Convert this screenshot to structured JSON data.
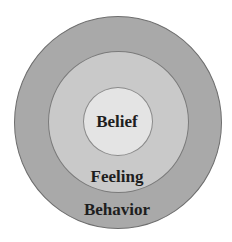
{
  "diagram": {
    "type": "concentric-circles",
    "layers": [
      {
        "id": "outer",
        "label": "Behavior",
        "fill": "#a9a9a9"
      },
      {
        "id": "middle",
        "label": "Feeling",
        "fill": "#c9c9c9"
      },
      {
        "id": "inner",
        "label": "Belief",
        "fill": "#e4e4e4"
      }
    ]
  }
}
